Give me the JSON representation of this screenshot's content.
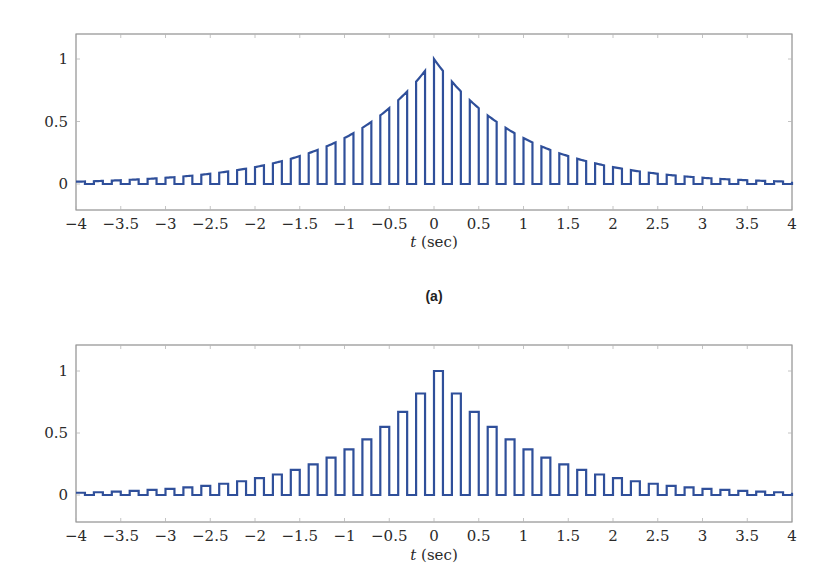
{
  "figure": {
    "caption_a": "(a)",
    "line_color": "#2f4f9a",
    "frame_color": "#7a7a7a"
  },
  "chart_data": [
    {
      "id": "a",
      "type": "line",
      "title": "",
      "caption": "(a)",
      "description": "Natural (flat-top following signal) sampling of x(t)=exp(-|t|): pulses of width 0.1 s every 0.2 s, top follows exp(-|t|)",
      "xlabel": "t (sec)",
      "ylabel": "",
      "xlim": [
        -4,
        4
      ],
      "ylim": [
        -0.2,
        1.2
      ],
      "xticks": [
        -4,
        -3.5,
        -3,
        -2.5,
        -2,
        -1.5,
        -1,
        -0.5,
        0,
        0.5,
        1,
        1.5,
        2,
        2.5,
        3,
        3.5,
        4
      ],
      "xtick_labels": [
        "−4",
        "−3.5",
        "−3",
        "−2.5",
        "−2",
        "−1.5",
        "−1",
        "−0.5",
        "0",
        "0.5",
        "1",
        "1.5",
        "2",
        "2.5",
        "3",
        "3.5",
        "4"
      ],
      "yticks": [
        0,
        0.5,
        1
      ],
      "ytick_labels": [
        "0",
        "0.5",
        "1"
      ],
      "grid": false,
      "legend": null,
      "signal": {
        "function": "exp(-|t|)",
        "period": 0.2,
        "pulse_width": 0.1,
        "top": "follow"
      },
      "sample_times": [
        -4,
        -3.8,
        -3.6,
        -3.4,
        -3.2,
        -3,
        -2.8,
        -2.6,
        -2.4,
        -2.2,
        -2,
        -1.8,
        -1.6,
        -1.4,
        -1.2,
        -1,
        -0.8,
        -0.6,
        -0.4,
        -0.2,
        0,
        0.2,
        0.4,
        0.6,
        0.8,
        1,
        1.2,
        1.4,
        1.6,
        1.8,
        2,
        2.2,
        2.4,
        2.6,
        2.8,
        3,
        3.2,
        3.4,
        3.6,
        3.8
      ],
      "sample_values": [
        0.018,
        0.022,
        0.027,
        0.033,
        0.041,
        0.05,
        0.061,
        0.074,
        0.091,
        0.111,
        0.135,
        0.165,
        0.202,
        0.247,
        0.301,
        0.368,
        0.449,
        0.549,
        0.67,
        0.819,
        1.0,
        0.819,
        0.67,
        0.549,
        0.449,
        0.368,
        0.301,
        0.247,
        0.202,
        0.165,
        0.135,
        0.111,
        0.091,
        0.074,
        0.061,
        0.05,
        0.041,
        0.033,
        0.027,
        0.022
      ]
    },
    {
      "id": "b",
      "type": "line",
      "title": "",
      "caption": "",
      "description": "Flat-top (sample-and-hold) sampling of x(t)=exp(-|t|): pulses of width 0.1 s every 0.2 s, height held at x(kT)",
      "xlabel": "t (sec)",
      "ylabel": "",
      "xlim": [
        -4,
        4
      ],
      "ylim": [
        -0.2,
        1.2
      ],
      "xticks": [
        -4,
        -3.5,
        -3,
        -2.5,
        -2,
        -1.5,
        -1,
        -0.5,
        0,
        0.5,
        1,
        1.5,
        2,
        2.5,
        3,
        3.5,
        4
      ],
      "xtick_labels": [
        "−4",
        "−3.5",
        "−3",
        "−2.5",
        "−2",
        "−1.5",
        "−1",
        "−0.5",
        "0",
        "0.5",
        "1",
        "1.5",
        "2",
        "2.5",
        "3",
        "3.5",
        "4"
      ],
      "yticks": [
        0,
        0.5,
        1
      ],
      "ytick_labels": [
        "0",
        "0.5",
        "1"
      ],
      "grid": false,
      "legend": null,
      "signal": {
        "function": "exp(-|t|)",
        "period": 0.2,
        "pulse_width": 0.1,
        "top": "hold"
      },
      "sample_times": [
        -4,
        -3.8,
        -3.6,
        -3.4,
        -3.2,
        -3,
        -2.8,
        -2.6,
        -2.4,
        -2.2,
        -2,
        -1.8,
        -1.6,
        -1.4,
        -1.2,
        -1,
        -0.8,
        -0.6,
        -0.4,
        -0.2,
        0,
        0.2,
        0.4,
        0.6,
        0.8,
        1,
        1.2,
        1.4,
        1.6,
        1.8,
        2,
        2.2,
        2.4,
        2.6,
        2.8,
        3,
        3.2,
        3.4,
        3.6,
        3.8
      ],
      "sample_values": [
        0.018,
        0.022,
        0.027,
        0.033,
        0.041,
        0.05,
        0.061,
        0.074,
        0.091,
        0.111,
        0.135,
        0.165,
        0.202,
        0.247,
        0.301,
        0.368,
        0.449,
        0.549,
        0.67,
        0.819,
        1.0,
        0.819,
        0.67,
        0.549,
        0.449,
        0.368,
        0.301,
        0.247,
        0.202,
        0.165,
        0.135,
        0.111,
        0.091,
        0.074,
        0.061,
        0.05,
        0.041,
        0.033,
        0.027,
        0.022
      ]
    }
  ]
}
